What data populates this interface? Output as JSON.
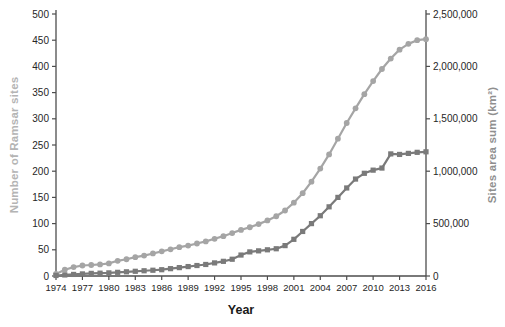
{
  "chart_data": {
    "type": "line",
    "title": "",
    "xlabel": "Year",
    "grid": false,
    "legend": "none",
    "x": [
      1974,
      1975,
      1976,
      1977,
      1978,
      1979,
      1980,
      1981,
      1982,
      1983,
      1984,
      1985,
      1986,
      1987,
      1988,
      1989,
      1990,
      1991,
      1992,
      1993,
      1994,
      1995,
      1996,
      1997,
      1998,
      1999,
      2000,
      2001,
      2002,
      2003,
      2004,
      2005,
      2006,
      2007,
      2008,
      2009,
      2010,
      2011,
      2012,
      2013,
      2014,
      2015,
      2016
    ],
    "x_tick_labels": [
      "1974",
      "1977",
      "1980",
      "1983",
      "1986",
      "1989",
      "1992",
      "1995",
      "1998",
      "2001",
      "2004",
      "2007",
      "2010",
      "2013",
      "2016"
    ],
    "left_axis": {
      "label": "Number of Ramsar sites",
      "min": 0,
      "max": 500,
      "tick_step": 50,
      "tick_labels": [
        "0",
        "50",
        "100",
        "150",
        "200",
        "250",
        "300",
        "350",
        "400",
        "450",
        "500"
      ],
      "label_color": "#b4b4b4",
      "tick_text_color": "#262626"
    },
    "right_axis": {
      "label": "Sites area sum (km²)",
      "min": 0,
      "max": 2500000,
      "tick_step": 500000,
      "tick_labels": [
        "0",
        "500,000",
        "1,000,000",
        "1,500,000",
        "2,000,000",
        "2,500,000"
      ],
      "label_color": "#8f8f8f",
      "tick_text_color": "#262626"
    },
    "series": [
      {
        "name": "Number of Ramsar sites",
        "axis": "left",
        "marker": "circle",
        "color": "#a5a5a5",
        "values": [
          4,
          12,
          17,
          20,
          21,
          22,
          24,
          29,
          32,
          36,
          39,
          43,
          47,
          51,
          55,
          58,
          62,
          66,
          71,
          76,
          82,
          88,
          93,
          99,
          106,
          114,
          125,
          140,
          158,
          180,
          205,
          232,
          262,
          292,
          320,
          347,
          372,
          395,
          415,
          432,
          443,
          450,
          452
        ]
      },
      {
        "name": "Sites area sum (km²)",
        "axis": "right",
        "marker": "square",
        "color": "#7a7a7a",
        "values": [
          5000,
          10000,
          15000,
          20000,
          25000,
          27000,
          30000,
          35000,
          40000,
          45000,
          50000,
          55000,
          60000,
          70000,
          80000,
          90000,
          100000,
          110000,
          125000,
          140000,
          160000,
          200000,
          230000,
          240000,
          250000,
          260000,
          290000,
          350000,
          425000,
          500000,
          575000,
          660000,
          750000,
          840000,
          925000,
          980000,
          1010000,
          1030000,
          1165000,
          1160000,
          1170000,
          1180000,
          1185000
        ]
      }
    ],
    "axis_line_color": "#4d4d4d"
  }
}
